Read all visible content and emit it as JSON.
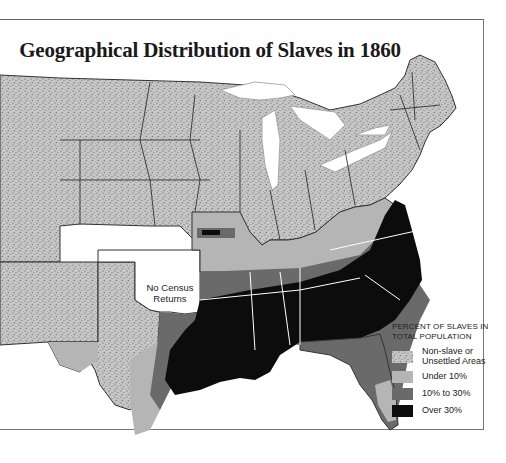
{
  "title": "Geographical Distribution of Slaves in 1860",
  "map": {
    "annotation_no_census": "No Census Returns",
    "annotation_no_census_lines": [
      "No Census",
      "Returns"
    ]
  },
  "legend": {
    "heading_lines": [
      "PERCENT OF SLAVES IN",
      "TOTAL POPULATION"
    ],
    "items": [
      {
        "label_lines": [
          "Non-slave or",
          "Unsettled Areas"
        ],
        "category": "non-slave-or-unsettled",
        "color": "#b8b8b8",
        "pattern": "stipple"
      },
      {
        "label_lines": [
          "Under 10%"
        ],
        "category": "under-10",
        "color": "#b5b5b5",
        "pattern": "solid"
      },
      {
        "label_lines": [
          "10% to 30%"
        ],
        "category": "10-to-30",
        "color": "#6a6a6a",
        "pattern": "solid"
      },
      {
        "label_lines": [
          "Over 30%"
        ],
        "category": "over-30",
        "color": "#0c0c0c",
        "pattern": "solid"
      }
    ]
  },
  "colors": {
    "background": "#ffffff",
    "stipple_base": "#c4c4c4",
    "under_10": "#b5b5b5",
    "ten_to_30": "#6a6a6a",
    "over_30": "#0c0c0c",
    "border": "#333333",
    "water": "#ffffff"
  }
}
